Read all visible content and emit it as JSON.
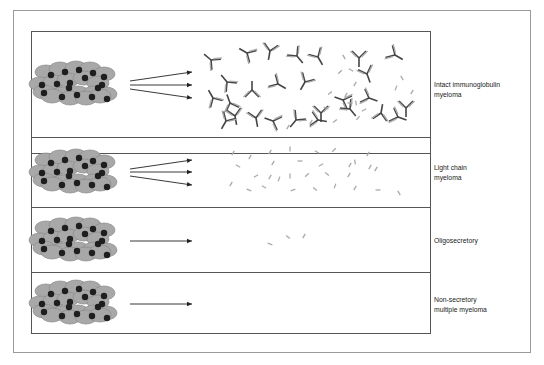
{
  "figure": {
    "type": "diagram",
    "colors": {
      "outer_border": "#9a9a9a",
      "panel_border": "#555555",
      "cell_fill": "#a8a8a8",
      "cell_stroke": "#8a8a8a",
      "nucleus": "#1e1e1e",
      "arrow": "#222222",
      "heavy_chain": "#444444",
      "light_chain": "#aaaaaa"
    },
    "rows": [
      {
        "label_line1": "Intact immunoglobulin",
        "label_line2": "myeloma",
        "arrows": 3,
        "product": "intact immunoglobulins + light chains"
      },
      {
        "label_line1": "Light chain",
        "label_line2": "myeloma",
        "arrows": 3,
        "product": "free light chains"
      },
      {
        "label_line1": "Oligosecretory",
        "label_line2": "",
        "arrows": 1,
        "product": "few light chains"
      },
      {
        "label_line1": "Non-secretory",
        "label_line2": "multiple myeloma",
        "arrows": 1,
        "product": "none"
      }
    ]
  }
}
